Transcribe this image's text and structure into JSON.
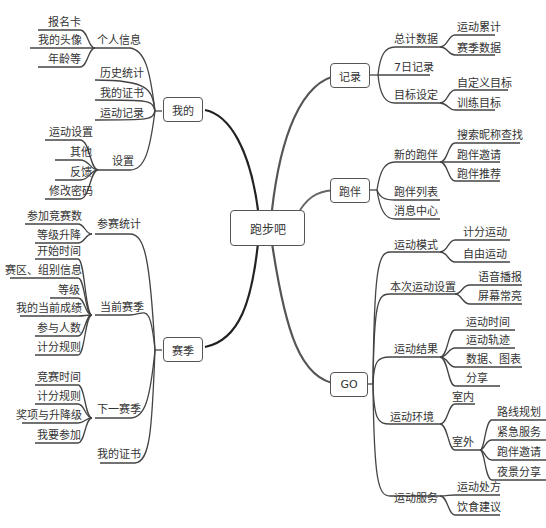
{
  "root": {
    "label": "跑步吧"
  },
  "left": {
    "wode": {
      "label": "我的",
      "children": {
        "personal": {
          "label": "个人信息",
          "items": [
            "报名卡",
            "我的头像",
            "年龄等"
          ]
        },
        "history": {
          "label": "历史统计"
        },
        "certs": {
          "label": "我的证书"
        },
        "records": {
          "label": "运动记录"
        },
        "settings": {
          "label": "设置",
          "items": [
            "运动设置",
            "其他",
            "反馈",
            "修改密码"
          ]
        }
      }
    },
    "season": {
      "label": "赛季",
      "children": {
        "stats": {
          "label": "参赛统计",
          "items": [
            "参加竞赛数",
            "等级升降"
          ]
        },
        "current": {
          "label": "当前赛季",
          "items": [
            "开始时间",
            "赛区、组别信息",
            "等级",
            "我的当前成绩",
            "参与人数",
            "计分规则"
          ]
        },
        "next": {
          "label": "下一赛季",
          "items": [
            "竞赛时间",
            "计分规则",
            "奖项与升降级",
            "我要参加"
          ]
        },
        "certs": {
          "label": "我的证书"
        }
      }
    }
  },
  "right": {
    "record": {
      "label": "记录",
      "children": {
        "total": {
          "label": "总计数据",
          "items": [
            "运动累计",
            "赛季数据"
          ]
        },
        "week": {
          "label": "7日记录"
        },
        "goal": {
          "label": "目标设定",
          "items": [
            "自定义目标",
            "训练目标"
          ]
        }
      }
    },
    "partner": {
      "label": "跑伴",
      "children": {
        "new": {
          "label": "新的跑伴",
          "items": [
            "搜索昵称查找",
            "跑伴邀请",
            "跑伴推荐"
          ]
        },
        "list": {
          "label": "跑伴列表"
        },
        "msg": {
          "label": "消息中心"
        }
      }
    },
    "go": {
      "label": "GO",
      "children": {
        "mode": {
          "label": "运动模式",
          "items": [
            "计分运动",
            "自由运动"
          ]
        },
        "setting": {
          "label": "本次运动设置",
          "items": [
            "语音播报",
            "屏幕常亮"
          ]
        },
        "result": {
          "label": "运动结果",
          "items": [
            "运动时间",
            "运动轨迹",
            "数据、图表",
            "分享"
          ]
        },
        "env": {
          "label": "运动环境",
          "indoor": {
            "label": "室内"
          },
          "outdoor": {
            "label": "室外",
            "items": [
              "路线规划",
              "紧急服务",
              "跑伴邀请",
              "夜景分享"
            ]
          }
        },
        "service": {
          "label": "运动服务",
          "items": [
            "运动处方",
            "饮食建议"
          ]
        }
      }
    }
  }
}
